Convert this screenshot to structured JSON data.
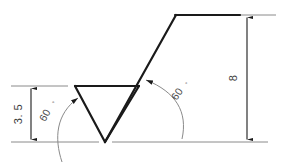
{
  "drawing": {
    "title": "thread-profile-dimensioned-sketch",
    "line_color": "#1a1a1a",
    "thin_line_color": "#777777",
    "text_color": "#3a3a3a",
    "background": "#ffffff"
  },
  "dimensions": {
    "left_height": {
      "value": "3. 5",
      "name": "left-vertical-dimension"
    },
    "right_height": {
      "value": "8",
      "name": "right-vertical-dimension"
    }
  },
  "angles": {
    "left": {
      "value": "60",
      "symbol": "°"
    },
    "right": {
      "value": "60",
      "symbol": "°"
    }
  },
  "geometry": {
    "triangle": {
      "apex_bottom": [
        105,
        142
      ],
      "top_left": [
        75,
        86
      ],
      "top_right": [
        139,
        86
      ]
    },
    "diagonal": {
      "start": [
        105,
        142
      ],
      "end": [
        176,
        15
      ]
    },
    "top_horizontal": {
      "start": [
        176,
        15
      ],
      "end": [
        240,
        15
      ]
    },
    "baseline_y": 142,
    "upper_left_extension_y": 86
  }
}
